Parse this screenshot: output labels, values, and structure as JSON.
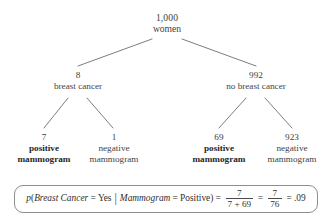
{
  "diagram": {
    "title_alt": "Probability tree for breast cancer screening",
    "root": {
      "count": "1,000",
      "label": "women"
    },
    "level2": [
      {
        "count": "8",
        "label": "breast cancer",
        "emphasis": "normal"
      },
      {
        "count": "992",
        "label": "no breast cancer",
        "emphasis": "normal"
      }
    ],
    "leaves": [
      {
        "count": "7",
        "line1": "positive",
        "line2": "mammogram",
        "emphasis": "bold"
      },
      {
        "count": "1",
        "line1": "negative",
        "line2": "mammogram",
        "emphasis": "normal"
      },
      {
        "count": "69",
        "line1": "positive",
        "line2": "mammogram",
        "emphasis": "bold"
      },
      {
        "count": "923",
        "line1": "negative",
        "line2": "mammogram",
        "emphasis": "normal"
      }
    ]
  },
  "formula": {
    "p": "p",
    "open_paren": "(",
    "event_var": "Breast Cancer",
    "equals1": "=",
    "event_value": "Yes",
    "pipe": "|",
    "cond_var": "Mammogram",
    "equals2": "=",
    "cond_value": "Positive",
    "close_paren": ")",
    "equals3": "=",
    "frac1_numer": "7",
    "frac1_denom": "7 + 69",
    "equals4": "=",
    "frac2_numer": "7",
    "frac2_denom": "76",
    "equals5": "=",
    "result": ".09"
  },
  "style": {
    "line_color": "#6e6e72",
    "box_border": "#8d8d8d",
    "text_color": "#434343",
    "background": "#ffffff"
  }
}
